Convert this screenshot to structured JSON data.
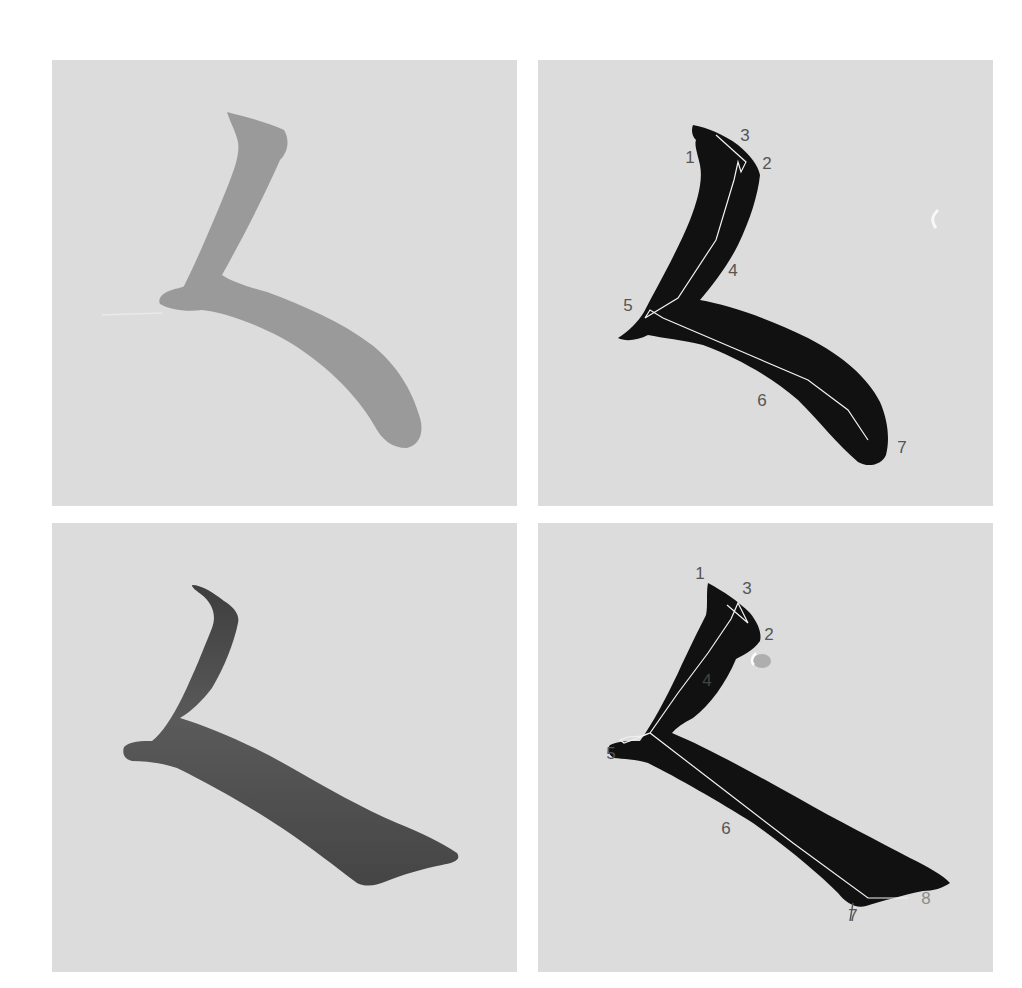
{
  "figure": {
    "colors": {
      "paper": "#dcdcdc",
      "ink_faint": "#8e8e8e",
      "ink_medium": "#555555",
      "ink_black": "#111111",
      "trace_line": "#f2f2f2",
      "label": "#555555"
    },
    "panels": [
      {
        "id": "top-left",
        "type": "original-stroke",
        "ink": "faint gray",
        "labels": []
      },
      {
        "id": "top-right",
        "type": "traced-stroke",
        "ink": "black",
        "labels": [
          {
            "text": "1",
            "x": 152,
            "y": 97
          },
          {
            "text": "3",
            "x": 207,
            "y": 75
          },
          {
            "text": "2",
            "x": 229,
            "y": 103
          },
          {
            "text": "4",
            "x": 195,
            "y": 210
          },
          {
            "text": "5",
            "x": 90,
            "y": 245
          },
          {
            "text": "6",
            "x": 224,
            "y": 340
          },
          {
            "text": "7",
            "x": 364,
            "y": 387
          }
        ]
      },
      {
        "id": "bottom-left",
        "type": "original-stroke",
        "ink": "dark gray",
        "labels": []
      },
      {
        "id": "bottom-right",
        "type": "traced-stroke",
        "ink": "black",
        "labels": [
          {
            "text": "1",
            "x": 162,
            "y": 50
          },
          {
            "text": "3",
            "x": 209,
            "y": 65
          },
          {
            "text": "2",
            "x": 231,
            "y": 111
          },
          {
            "text": "4",
            "x": 169,
            "y": 157,
            "light": true
          },
          {
            "text": "5",
            "x": 73,
            "y": 230
          },
          {
            "text": "6",
            "x": 188,
            "y": 305
          },
          {
            "text": "7",
            "x": 315,
            "y": 390
          },
          {
            "text": "8",
            "x": 388,
            "y": 373,
            "light": true
          }
        ]
      }
    ]
  }
}
